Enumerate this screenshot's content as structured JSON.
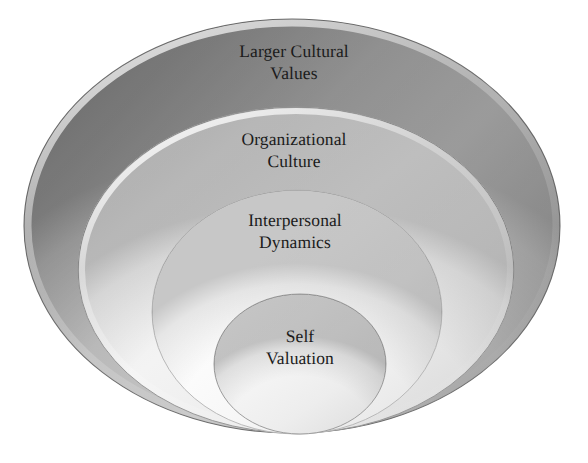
{
  "diagram": {
    "type": "nested-ellipses",
    "background_color": "#ffffff",
    "text_color": "#1b1b1b",
    "rings": [
      {
        "id": "outer",
        "label": "Larger Cultural\nValues",
        "label_line1": "Larger Cultural",
        "label_line2": "Values",
        "level": 1,
        "fill_light": "#c9c9c9",
        "fill_dark": "#8e8e8e",
        "stroke": "#6f6f6f",
        "cx": 292,
        "cy": 226,
        "rx": 268,
        "ry": 207
      },
      {
        "id": "second",
        "label": "Organizational\nCulture",
        "label_line1": "Organizational",
        "label_line2": "Culture",
        "level": 2,
        "fill_light": "#f2f2f2",
        "fill_dark": "#cfcfcf",
        "stroke": "#9a9a9a",
        "cx": 296,
        "cy": 270,
        "rx": 218,
        "ry": 163
      },
      {
        "id": "third",
        "label": "Interpersonal\nDynamics",
        "label_line1": "Interpersonal",
        "label_line2": "Dynamics",
        "level": 3,
        "fill_light": "#ffffff",
        "fill_dark": "#e6e6e6",
        "stroke": "#b4b4b4",
        "cx": 297,
        "cy": 312,
        "rx": 145,
        "ry": 122
      },
      {
        "id": "inner",
        "label": "Self\nValuation",
        "label_line1": "Self",
        "label_line2": "Valuation",
        "level": 4,
        "fill_light": "#fbfbfb",
        "fill_dark": "#dcdcdc",
        "stroke": "#9f9f9f",
        "cx": 300,
        "cy": 364,
        "rx": 86,
        "ry": 70
      }
    ]
  }
}
